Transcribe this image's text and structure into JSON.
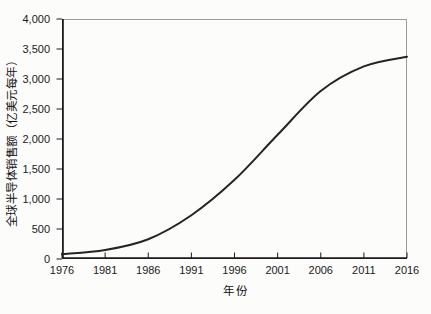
{
  "chart_data": {
    "type": "line",
    "title": "",
    "xlabel": "年份",
    "ylabel": "全球半导体销售额（亿美元每年）",
    "series": [
      {
        "name": "全球半导体销售额",
        "x": [
          1976,
          1981,
          1986,
          1991,
          1996,
          2001,
          2006,
          2011,
          2016
        ],
        "values": [
          80,
          150,
          330,
          730,
          1320,
          2070,
          2800,
          3210,
          3370
        ]
      }
    ],
    "curve_shape": "smooth s-curve (logistic growth), flattening after 2011",
    "xlim": [
      1976,
      2016
    ],
    "ylim": [
      0,
      4000
    ],
    "x_tick_labels": [
      "1976",
      "1981",
      "1986",
      "1991",
      "1996",
      "2001",
      "2006",
      "2011",
      "2016"
    ],
    "y_tick_values": [
      0,
      500,
      1000,
      1500,
      2000,
      2500,
      3000,
      3500,
      4000
    ],
    "y_tick_labels": [
      "0",
      "500",
      "1,000",
      "1,500",
      "2,000",
      "2,500",
      "3,000",
      "3,500",
      "4,000"
    ],
    "grid": false,
    "legend": "none",
    "colors": {
      "line": "#242424",
      "axis": "#1a1a1a",
      "frame": "#9b9b9b",
      "text": "#1a1a1a",
      "background": "#fcfcfb"
    }
  }
}
